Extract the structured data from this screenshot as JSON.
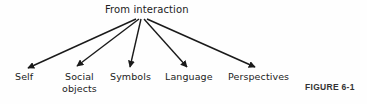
{
  "diagram": {
    "root": {
      "label": "From interaction"
    },
    "children": [
      {
        "id": "self",
        "label": "Self"
      },
      {
        "id": "social",
        "label": "Social objects",
        "lines": [
          "Social",
          "objects"
        ]
      },
      {
        "id": "symbols",
        "label": "Symbols"
      },
      {
        "id": "language",
        "label": "Language"
      },
      {
        "id": "perspectives",
        "label": "Perspectives"
      }
    ],
    "caption": "FIGURE 6-1",
    "colors": {
      "ink": "#1a1a1a",
      "background": "#fefefe"
    }
  }
}
